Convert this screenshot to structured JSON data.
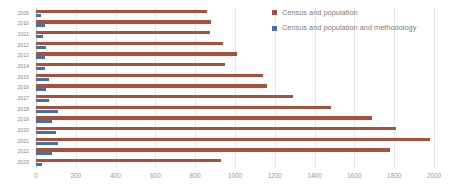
{
  "chart_data": {
    "type": "bar",
    "orientation": "horizontal",
    "title": "",
    "xlabel": "",
    "ylabel": "",
    "xlim": [
      0,
      2000
    ],
    "xticks": [
      0,
      200,
      400,
      600,
      800,
      1000,
      1200,
      1400,
      1600,
      1800,
      2000
    ],
    "grid": true,
    "legend_position": "right-top",
    "categories": [
      "2009",
      "2010",
      "2011",
      "2012",
      "2013",
      "2014",
      "2015",
      "2016",
      "2017",
      "2018",
      "2019",
      "2020",
      "2021",
      "2022",
      "2023"
    ],
    "series": [
      {
        "name": "Census and population",
        "color": "#a8503c",
        "values": [
          860,
          880,
          875,
          940,
          1010,
          950,
          1140,
          1160,
          1290,
          1480,
          1690,
          1810,
          1980,
          1780,
          930
        ]
      },
      {
        "name": "Census and population and methodology",
        "color": "#4472a8",
        "values": [
          25,
          45,
          35,
          50,
          45,
          45,
          65,
          50,
          65,
          110,
          80,
          100,
          110,
          80,
          30
        ]
      }
    ]
  },
  "legend": {
    "items": [
      {
        "label": "Census and population",
        "color": "#a8503c",
        "swatch_name": "legend-swatch-census-and-population"
      },
      {
        "label": "Census and population and methodology",
        "color": "#4472a8",
        "swatch_name": "legend-swatch-census-and-population-and-methodology"
      }
    ]
  }
}
